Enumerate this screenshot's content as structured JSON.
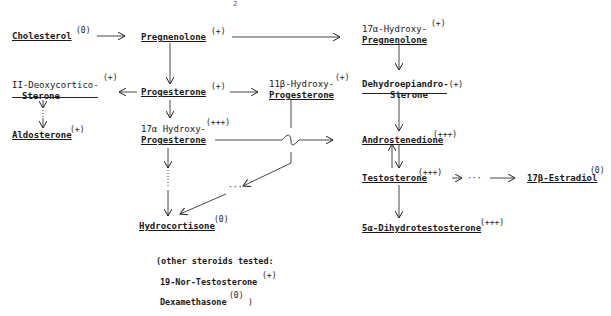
{
  "page_number": "2",
  "nodes": {
    "cholesterol": {
      "name": "Cholesterol",
      "activity": "(0)"
    },
    "pregnenolone": {
      "name": "Pregnenolone",
      "activity": "(+)"
    },
    "hydroxy_pregnenolone": {
      "line1": "17α-Hydroxy-",
      "line2": "Pregnenolone",
      "activity": "(+)"
    },
    "deoxycorticosterone": {
      "line1": "II-Deoxycortico-",
      "line2": "Sterone",
      "activity": "(+)"
    },
    "progesterone": {
      "name": "Progesterone",
      "activity": "(+)"
    },
    "hydroxy_11b_progesterone": {
      "line1": "11β-Hydroxy-",
      "line2": "Progesterone",
      "activity": "(+)"
    },
    "dehydroepiandrosterone": {
      "line1": "Dehydroepiandro-",
      "line2": "Sterone",
      "activity": "(+)"
    },
    "aldosterone": {
      "name": "Aldosterone",
      "activity": "(+)"
    },
    "hydroxy_17a_progesterone": {
      "line1": "17α Hydroxy-",
      "line2": "Progesterone",
      "activity": "(+++)"
    },
    "androstenedione": {
      "name": "Androstenedione",
      "activity": "(+++)"
    },
    "testosterone": {
      "name": "Testosterone",
      "activity": "(+++)"
    },
    "estradiol": {
      "name": "17β-Estradiol",
      "activity": "(0)"
    },
    "hydrocortisone": {
      "name": "Hydrocortisone",
      "activity": "(0)"
    },
    "dihydrotestosterone": {
      "name": "5α-Dihydrotestosterone",
      "activity": "(+++)"
    }
  },
  "edges": [
    {
      "from": "Cholesterol",
      "to": "Pregnenolone",
      "style": "solid"
    },
    {
      "from": "Pregnenolone",
      "to": "17α-Hydroxy-Pregnenolone",
      "style": "solid"
    },
    {
      "from": "Pregnenolone",
      "to": "Progesterone",
      "style": "solid"
    },
    {
      "from": "17α-Hydroxy-Pregnenolone",
      "to": "Dehydroepiandrosterone",
      "style": "solid"
    },
    {
      "from": "Progesterone",
      "to": "II-Deoxycorticosterone",
      "style": "solid"
    },
    {
      "from": "Progesterone",
      "to": "11β-Hydroxy-Progesterone",
      "style": "solid"
    },
    {
      "from": "Progesterone",
      "to": "17α Hydroxy-Progesterone",
      "style": "solid"
    },
    {
      "from": "II-Deoxycorticosterone",
      "to": "Aldosterone",
      "style": "dotted"
    },
    {
      "from": "Dehydroepiandrosterone",
      "to": "Androstenedione",
      "style": "solid"
    },
    {
      "from": "17α Hydroxy-Progesterone",
      "to": "Androstenedione",
      "style": "solid"
    },
    {
      "from": "17α Hydroxy-Progesterone",
      "to": "Hydrocortisone",
      "style": "dotted"
    },
    {
      "from": "11β-Hydroxy-Progesterone",
      "to": "Hydrocortisone",
      "style": "dotted"
    },
    {
      "from": "Androstenedione",
      "to": "Testosterone",
      "style": "bidirectional"
    },
    {
      "from": "Testosterone",
      "to": "17β-Estradiol",
      "style": "dotted"
    },
    {
      "from": "Testosterone",
      "to": "5α-Dihydrotestosterone",
      "style": "solid"
    }
  ],
  "note": {
    "line1": "(other steroids tested:",
    "line2_name": "19-Nor-Testosterone",
    "line2_activity": "(+)",
    "line3_name": "Dexamethasone",
    "line3_activity": "(0)",
    "line3_close": ")"
  }
}
